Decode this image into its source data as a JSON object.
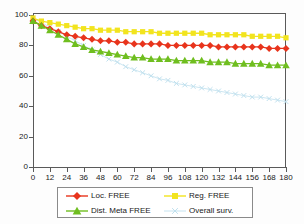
{
  "chart_data": {
    "type": "line",
    "title": "",
    "xlabel": "",
    "ylabel": "",
    "xlim": [
      0,
      180
    ],
    "ylim": [
      0,
      100
    ],
    "grid": false,
    "legend_position": "bottom",
    "x_ticks": [
      0,
      12,
      24,
      36,
      48,
      60,
      72,
      84,
      96,
      108,
      120,
      132,
      144,
      156,
      168,
      180
    ],
    "y_ticks": [
      0,
      20,
      40,
      60,
      80,
      100
    ],
    "x": [
      0,
      6,
      12,
      18,
      24,
      30,
      36,
      42,
      48,
      54,
      60,
      66,
      72,
      78,
      84,
      90,
      96,
      102,
      108,
      114,
      120,
      126,
      132,
      138,
      144,
      150,
      156,
      162,
      168,
      174,
      180
    ],
    "series": [
      {
        "name": "Loc. FREE",
        "color": "#E8341C",
        "marker": "diamond",
        "values": [
          96,
          93,
          91,
          89,
          87,
          86,
          85,
          84,
          83,
          83,
          82,
          82,
          81,
          81,
          81,
          81,
          80,
          80,
          80,
          80,
          80,
          80,
          79,
          79,
          79,
          79,
          79,
          79,
          78,
          78,
          78
        ]
      },
      {
        "name": "Reg. FREE",
        "color": "#F2E41E",
        "marker": "square",
        "values": [
          98,
          96,
          95,
          94,
          93,
          92,
          91,
          91,
          90,
          90,
          90,
          89,
          89,
          89,
          89,
          88,
          88,
          88,
          88,
          88,
          88,
          87,
          87,
          87,
          87,
          87,
          86,
          86,
          86,
          86,
          85
        ]
      },
      {
        "name": "Dist. Meta FREE",
        "color": "#6FBE1F",
        "marker": "triangle",
        "values": [
          96,
          93,
          90,
          87,
          84,
          81,
          79,
          77,
          76,
          75,
          74,
          73,
          72,
          72,
          71,
          71,
          71,
          70,
          70,
          70,
          70,
          69,
          69,
          69,
          68,
          68,
          68,
          68,
          67,
          67,
          67
        ]
      },
      {
        "name": "Overall surv.",
        "color": "#BFE0EE",
        "marker": "x",
        "values": [
          98,
          95,
          92,
          89,
          86,
          83,
          80,
          77,
          74,
          71,
          69,
          66,
          64,
          62,
          60,
          58,
          57,
          55,
          54,
          53,
          52,
          51,
          50,
          49,
          48,
          47,
          46,
          46,
          45,
          44,
          43
        ]
      }
    ]
  },
  "legend": {
    "items": [
      {
        "label": "Loc. FREE",
        "color": "#E8341C",
        "marker": "diamond"
      },
      {
        "label": "Reg. FREE",
        "color": "#F2E41E",
        "marker": "square"
      },
      {
        "label": "Dist. Meta FREE",
        "color": "#6FBE1F",
        "marker": "triangle"
      },
      {
        "label": "Overall surv.",
        "color": "#BFE0EE",
        "marker": "x"
      }
    ]
  }
}
